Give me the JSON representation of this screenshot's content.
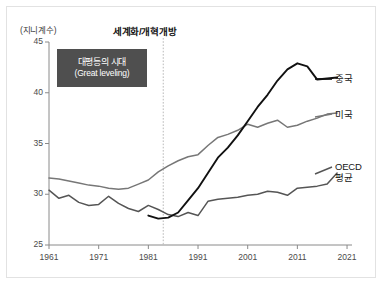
{
  "chart_data": {
    "type": "line",
    "title": "",
    "xlabel": "",
    "ylabel": "(지니계수)",
    "ylim": [
      25,
      45
    ],
    "xlim": [
      1961,
      2022
    ],
    "grid": false,
    "legend_position": "right-inline",
    "y_ticks": [
      25,
      30,
      35,
      40,
      45
    ],
    "x_ticks": [
      1961,
      1971,
      1981,
      1991,
      2001,
      2011,
      2021
    ],
    "annotations": [
      {
        "name": "great-leveling-box",
        "line1": "대평등의 시대",
        "line2": "(Great leveling)"
      },
      {
        "name": "globalization-marker",
        "text": "세계화/개혁개방",
        "x": 1984,
        "style": "dotted-vertical-line"
      }
    ],
    "series": [
      {
        "name": "중국",
        "color": "#111111",
        "x": [
          1981,
          1983,
          1985,
          1987,
          1989,
          1991,
          1993,
          1995,
          1997,
          1999,
          2001,
          2003,
          2005,
          2007,
          2009,
          2011,
          2013,
          2015,
          2017,
          2019
        ],
        "values": [
          27.9,
          27.6,
          27.7,
          28.2,
          29.4,
          30.6,
          32.1,
          33.6,
          34.6,
          35.8,
          37.2,
          38.6,
          39.8,
          41.2,
          42.3,
          42.9,
          42.6,
          41.3,
          41.4,
          41.5
        ]
      },
      {
        "name": "미국",
        "color": "#777777",
        "x": [
          1961,
          1963,
          1965,
          1967,
          1969,
          1971,
          1973,
          1975,
          1977,
          1979,
          1981,
          1983,
          1985,
          1987,
          1989,
          1991,
          1993,
          1995,
          1997,
          1999,
          2001,
          2003,
          2005,
          2007,
          2009,
          2011,
          2013,
          2015,
          2017,
          2019
        ],
        "values": [
          31.6,
          31.5,
          31.3,
          31.1,
          30.9,
          30.8,
          30.6,
          30.5,
          30.6,
          31.0,
          31.4,
          32.2,
          32.8,
          33.3,
          33.7,
          33.9,
          34.8,
          35.6,
          35.9,
          36.3,
          36.9,
          36.6,
          37.0,
          37.3,
          36.6,
          36.8,
          37.2,
          37.5,
          37.9,
          38.0
        ]
      },
      {
        "name": "OECD 평균",
        "color": "#555555",
        "x": [
          1961,
          1963,
          1965,
          1967,
          1969,
          1971,
          1973,
          1975,
          1977,
          1979,
          1981,
          1983,
          1985,
          1987,
          1989,
          1991,
          1993,
          1995,
          1997,
          1999,
          2001,
          2003,
          2005,
          2007,
          2009,
          2011,
          2013,
          2015,
          2017,
          2019
        ],
        "values": [
          30.4,
          29.6,
          29.9,
          29.2,
          28.9,
          29.0,
          29.8,
          29.1,
          28.6,
          28.3,
          28.9,
          28.5,
          28.0,
          27.8,
          28.2,
          27.9,
          29.3,
          29.5,
          29.6,
          29.7,
          29.9,
          30.0,
          30.3,
          30.2,
          29.9,
          30.6,
          30.7,
          30.8,
          31.0,
          32.1
        ]
      }
    ]
  },
  "axis": {
    "unit_label": "(지니계수)",
    "y_tick_labels": [
      "45",
      "40",
      "35",
      "30",
      "25"
    ],
    "x_tick_labels": [
      "1961",
      "1971",
      "1981",
      "1991",
      "2001",
      "2011",
      "2021"
    ]
  },
  "callout": {
    "line1": "대평등의 시대",
    "line2": "(Great leveling)",
    "bg_color": "#4f4f4f",
    "text_color": "#ffffff"
  },
  "event": {
    "title": "세계화/개혁개방"
  },
  "series_labels": {
    "china": "중국",
    "usa": "미국",
    "oecd_line1": "OECD",
    "oecd_line2": "평균"
  },
  "colors": {
    "china": "#111111",
    "usa": "#777777",
    "oecd": "#555555",
    "axis": "#8a8a8a",
    "frame": "#e2e2e2"
  }
}
